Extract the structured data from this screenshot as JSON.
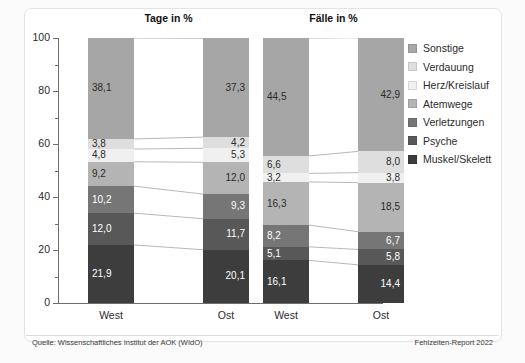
{
  "chart_data": {
    "type": "bar",
    "subtype": "stacked-bar-100-percent",
    "title": "",
    "panels": [
      {
        "title": "Tage in %",
        "categories": [
          "West",
          "Ost"
        ],
        "series": [
          {
            "name": "Muskel/Skelett",
            "color": "#3d3d3d",
            "values": [
              21.9,
              20.1
            ],
            "labels": [
              "21,9",
              "20,1"
            ],
            "label_color": "#ffffff"
          },
          {
            "name": "Psyche",
            "color": "#585858",
            "values": [
              12.0,
              11.7
            ],
            "labels": [
              "12,0",
              "11,7"
            ],
            "label_color": "#ffffff"
          },
          {
            "name": "Verletzungen",
            "color": "#767676",
            "values": [
              10.2,
              9.3
            ],
            "labels": [
              "10,2",
              "9,3"
            ],
            "label_color": "#ffffff"
          },
          {
            "name": "Atemwege",
            "color": "#b4b4b4",
            "values": [
              9.2,
              12.0
            ],
            "labels": [
              "9,2",
              "12,0"
            ],
            "label_color": "#2b2b2b"
          },
          {
            "name": "Herz/Kreislauf",
            "color": "#f0f0f0",
            "values": [
              4.8,
              5.3
            ],
            "labels": [
              "4,8",
              "5,3"
            ],
            "label_color": "#2b2b2b"
          },
          {
            "name": "Verdauung",
            "color": "#dedede",
            "values": [
              3.8,
              4.2
            ],
            "labels": [
              "3,8",
              "4,2"
            ],
            "label_color": "#2b2b2b"
          },
          {
            "name": "Sonstige",
            "color": "#a6a6a6",
            "values": [
              38.1,
              37.3
            ],
            "labels": [
              "38,1",
              "37,3"
            ],
            "label_color": "#2b2b2b"
          }
        ]
      },
      {
        "title": "Fälle in %",
        "categories": [
          "West",
          "Ost"
        ],
        "series": [
          {
            "name": "Muskel/Skelett",
            "color": "#3d3d3d",
            "values": [
              16.1,
              14.4
            ],
            "labels": [
              "16,1",
              "14,4"
            ],
            "label_color": "#ffffff"
          },
          {
            "name": "Psyche",
            "color": "#585858",
            "values": [
              5.1,
              5.8
            ],
            "labels": [
              "5,1",
              "5,8"
            ],
            "label_color": "#ffffff"
          },
          {
            "name": "Verletzungen",
            "color": "#767676",
            "values": [
              8.2,
              6.7
            ],
            "labels": [
              "8,2",
              "6,7"
            ],
            "label_color": "#ffffff"
          },
          {
            "name": "Atemwege",
            "color": "#b4b4b4",
            "values": [
              16.3,
              18.5
            ],
            "labels": [
              "16,3",
              "18,5"
            ],
            "label_color": "#2b2b2b"
          },
          {
            "name": "Herz/Kreislauf",
            "color": "#f0f0f0",
            "values": [
              3.2,
              3.8
            ],
            "labels": [
              "3,2",
              "3,8"
            ],
            "label_color": "#2b2b2b"
          },
          {
            "name": "Verdauung",
            "color": "#dedede",
            "values": [
              6.6,
              8.0
            ],
            "labels": [
              "6,6",
              "8,0"
            ],
            "label_color": "#2b2b2b"
          },
          {
            "name": "Sonstige",
            "color": "#a6a6a6",
            "values": [
              44.5,
              42.9
            ],
            "labels": [
              "44,5",
              "42,9"
            ],
            "label_color": "#2b2b2b"
          }
        ]
      }
    ],
    "ylim": [
      0,
      100
    ],
    "ylabel": "",
    "xlabel": "",
    "yticks": [
      0,
      20,
      40,
      60,
      80,
      100
    ],
    "ytick_labels": [
      "0",
      "20",
      "40",
      "60",
      "80",
      "100"
    ],
    "yminor_ticks": [
      10,
      30,
      50,
      70,
      90
    ],
    "grid": false,
    "legend_position": "right",
    "legend": [
      {
        "label": "Sonstige",
        "color": "#a6a6a6"
      },
      {
        "label": "Verdauung",
        "color": "#dedede"
      },
      {
        "label": "Herz/Kreislauf",
        "color": "#f0f0f0"
      },
      {
        "label": "Atemwege",
        "color": "#b4b4b4"
      },
      {
        "label": "Verletzungen",
        "color": "#767676"
      },
      {
        "label": "Psyche",
        "color": "#585858"
      },
      {
        "label": "Muskel/Skelett",
        "color": "#3d3d3d"
      }
    ]
  },
  "footer": {
    "source": "Quelle: Wissenschaftliches Institut der AOK (WIdO)",
    "credit": "Fehlzeiten-Report 2022"
  }
}
